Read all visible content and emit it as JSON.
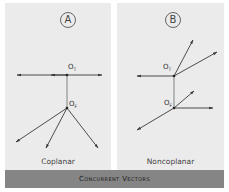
{
  "panels": [
    {
      "id": "A",
      "badge": "A",
      "caption": "Coplanar",
      "origin_top_label": "O",
      "origin_top_sub": "T",
      "origin_front_label": "O",
      "origin_front_sub": "F"
    },
    {
      "id": "B",
      "badge": "B",
      "caption": "Noncoplanar",
      "origin_top_label": "O",
      "origin_top_sub": "T",
      "origin_front_label": "O",
      "origin_front_sub": "F"
    }
  ],
  "banner": {
    "title": "Concurrent Vectors"
  },
  "colors": {
    "panel_bg": "#ebebeb",
    "banner_bg": "#858585",
    "line": "#3a3a3a"
  }
}
